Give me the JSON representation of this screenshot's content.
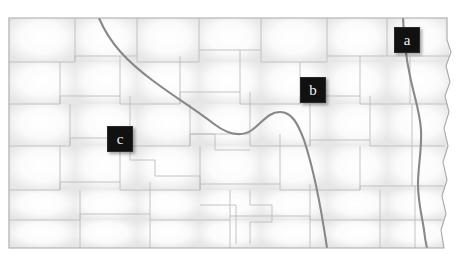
{
  "map": {
    "title": "North Dakota county map",
    "subject": "North Dakota",
    "background_color": "#ffffff",
    "land_fill": "#f2f2f2",
    "land_highlight": "#ffffff",
    "county_border_color": "#b9b9b9",
    "state_border_color": "#9a9a9a",
    "river_color": "#7a7a7a",
    "marker_fill": "#111111",
    "marker_text_color": "#f2f2f2",
    "features": [
      {
        "name": "Missouri River",
        "kind": "river",
        "id": "missouri-river"
      },
      {
        "name": "Red River",
        "kind": "river",
        "id": "red-river"
      }
    ]
  },
  "markers": [
    {
      "id": "marker-a",
      "label": "a",
      "x": 394,
      "y": 27
    },
    {
      "id": "marker-b",
      "label": "b",
      "x": 300,
      "y": 77
    },
    {
      "id": "marker-c",
      "label": "c",
      "x": 107,
      "y": 126
    }
  ]
}
